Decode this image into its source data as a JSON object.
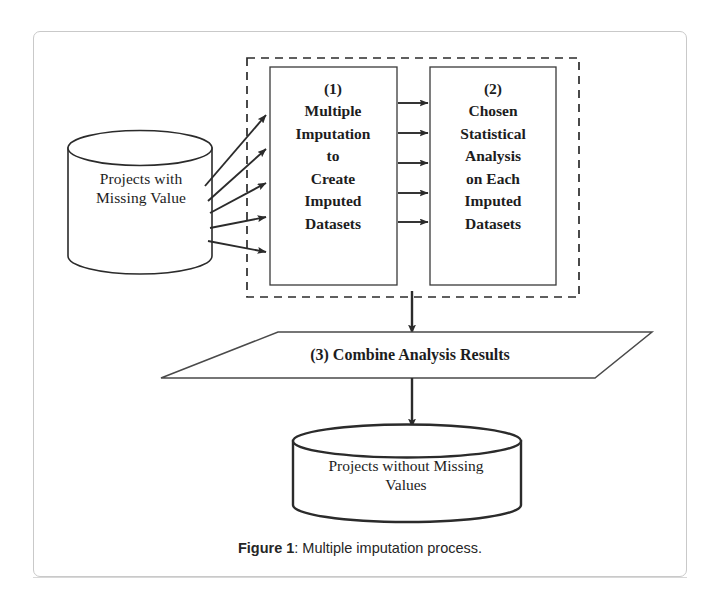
{
  "figure": {
    "caption_bold": "Figure 1",
    "caption_rest": ": Multiple imputation process."
  },
  "diagram": {
    "type": "flowchart",
    "title": "Multiple imputation process",
    "nodes": [
      {
        "id": "source-datastore",
        "shape": "cylinder",
        "label": "Projects with\nMissing Value"
      },
      {
        "id": "step-1",
        "shape": "rectangle",
        "label": "(1)\nMultiple\nImputation\nto\nCreate\nImputed\nDatasets"
      },
      {
        "id": "step-2",
        "shape": "rectangle",
        "label": "(2)\nChosen\nStatistical\nAnalysis\non Each\nImputed\nDatasets"
      },
      {
        "id": "step-3",
        "shape": "parallelogram",
        "label": "(3) Combine Analysis Results"
      },
      {
        "id": "result-datastore",
        "shape": "cylinder",
        "label": "Projects without Missing\nValues"
      }
    ],
    "grouping_box": {
      "id": "imputation-group",
      "style": "dashed",
      "contains": [
        "step-1",
        "step-2"
      ]
    },
    "edges": [
      {
        "from": "source-datastore",
        "to": "step-1",
        "count": 5,
        "style": "fan"
      },
      {
        "from": "step-1",
        "to": "step-2",
        "count": 5,
        "style": "parallel"
      },
      {
        "from": "imputation-group",
        "to": "step-3",
        "count": 1,
        "style": "vertical"
      },
      {
        "from": "step-3",
        "to": "result-datastore",
        "count": 1,
        "style": "vertical"
      }
    ],
    "colors": {
      "stroke": "#2b2b2b",
      "frame": "#c9c9c9",
      "background": "#ffffff",
      "text": "#1d1d1d"
    }
  }
}
